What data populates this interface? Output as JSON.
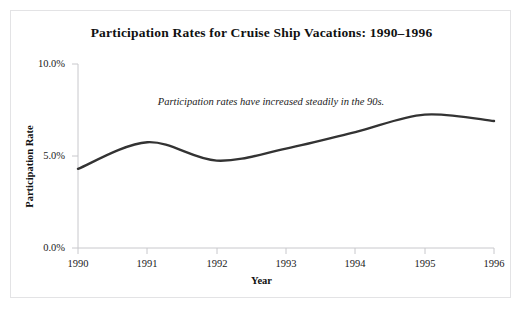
{
  "chart_data": {
    "type": "line",
    "title": "Participation Rates for Cruise Ship Vacations: 1990–1996",
    "xlabel": "Year",
    "ylabel": "Participation Rate",
    "categories": [
      "1990",
      "1991",
      "1992",
      "1993",
      "1994",
      "1995",
      "1996"
    ],
    "x": [
      1990,
      1991,
      1992,
      1993,
      1994,
      1995,
      1996
    ],
    "values": [
      4.3,
      5.75,
      4.75,
      5.4,
      6.3,
      7.25,
      6.9
    ],
    "series": [
      {
        "name": "Participation Rate",
        "values": [
          4.3,
          5.75,
          4.75,
          5.4,
          6.3,
          7.25,
          6.9
        ]
      }
    ],
    "ylim": [
      0.0,
      10.0
    ],
    "ytick_values": [
      0.0,
      5.0,
      10.0
    ],
    "ytick_labels": [
      "0.0%",
      "5.0%",
      "10.0%"
    ],
    "xtick_labels": [
      "1990",
      "1991",
      "1992",
      "1993",
      "1994",
      "1995",
      "1996"
    ],
    "grid": false,
    "legend": "none",
    "annotations": [
      {
        "text": "Participation rates have increased steadily in the 90s.",
        "x": 1992.1,
        "y": 8.6,
        "style": "italic"
      }
    ],
    "line_color": "#333333",
    "axis_color": "#c8c8cc",
    "border_color": "#e3e3e5",
    "background_color": "#ffffff"
  }
}
